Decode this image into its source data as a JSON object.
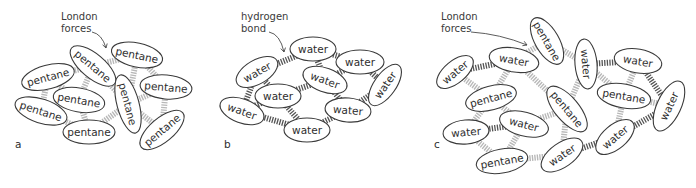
{
  "colors": {
    "london_bond": "#b8b8b8",
    "hydrogen_bond": "#555555",
    "outline": "#3a3a3a",
    "text": "#2e2e2e"
  },
  "legend": {
    "london_bond": "light grey hatched link",
    "hydrogen_bond": "dark grey hatched link"
  },
  "panels": [
    {
      "id": "a",
      "label": "a",
      "label_pos": [
        15,
        148
      ],
      "annotation": {
        "lines": [
          "London",
          "forces"
        ],
        "pos": [
          61,
          20
        ],
        "arrow": [
          [
            92,
            32
          ],
          [
            102,
            34
          ],
          [
            106,
            48
          ]
        ]
      },
      "molecules": [
        {
          "id": "a1",
          "text": "pentane",
          "cx": 48,
          "cy": 77,
          "rx": 27,
          "ry": 12,
          "rot": -15
        },
        {
          "id": "a2",
          "text": "pentane",
          "cx": 93,
          "cy": 66,
          "rx": 28,
          "ry": 12,
          "rot": 40
        },
        {
          "id": "a3",
          "text": "pentane",
          "cx": 137,
          "cy": 55,
          "rx": 26,
          "ry": 12,
          "rot": 12
        },
        {
          "id": "a4",
          "text": "pentane",
          "cx": 41,
          "cy": 111,
          "rx": 27,
          "ry": 12,
          "rot": 18
        },
        {
          "id": "a5",
          "text": "pentane",
          "cx": 79,
          "cy": 100,
          "rx": 26,
          "ry": 12,
          "rot": 10
        },
        {
          "id": "a6",
          "text": "pentane",
          "cx": 128,
          "cy": 104,
          "rx": 30,
          "ry": 11,
          "rot": 75
        },
        {
          "id": "a7",
          "text": "pentane",
          "cx": 166,
          "cy": 87,
          "rx": 26,
          "ry": 12,
          "rot": 5
        },
        {
          "id": "a8",
          "text": "pentane",
          "cx": 89,
          "cy": 132,
          "rx": 26,
          "ry": 12,
          "rot": 0
        },
        {
          "id": "a9",
          "text": "pentane",
          "cx": 162,
          "cy": 130,
          "rx": 27,
          "ry": 12,
          "rot": -40
        }
      ],
      "bonds": [
        {
          "from": "a1",
          "to": "a2",
          "type": "london"
        },
        {
          "from": "a2",
          "to": "a3",
          "type": "london"
        },
        {
          "from": "a1",
          "to": "a4",
          "type": "london"
        },
        {
          "from": "a1",
          "to": "a5",
          "type": "london"
        },
        {
          "from": "a2",
          "to": "a5",
          "type": "london"
        },
        {
          "from": "a2",
          "to": "a6",
          "type": "london"
        },
        {
          "from": "a3",
          "to": "a6",
          "type": "london"
        },
        {
          "from": "a3",
          "to": "a7",
          "type": "london"
        },
        {
          "from": "a6",
          "to": "a7",
          "type": "london"
        },
        {
          "from": "a4",
          "to": "a8",
          "type": "london"
        },
        {
          "from": "a5",
          "to": "a8",
          "type": "london"
        },
        {
          "from": "a8",
          "to": "a6",
          "type": "london"
        },
        {
          "from": "a6",
          "to": "a9",
          "type": "london"
        },
        {
          "from": "a7",
          "to": "a9",
          "type": "london"
        }
      ]
    },
    {
      "id": "b",
      "label": "b",
      "label_pos": [
        224,
        148
      ],
      "annotation": {
        "lines": [
          "hydrogen",
          "bond"
        ],
        "pos": [
          241,
          20
        ],
        "arrow": [
          [
            269,
            32
          ],
          [
            280,
            34
          ],
          [
            284,
            52
          ]
        ]
      },
      "molecules": [
        {
          "id": "b1",
          "text": "water",
          "cx": 313,
          "cy": 49,
          "rx": 23,
          "ry": 12,
          "rot": 0
        },
        {
          "id": "b2",
          "text": "water",
          "cx": 360,
          "cy": 62,
          "rx": 24,
          "ry": 12,
          "rot": 0
        },
        {
          "id": "b3",
          "text": "water",
          "cx": 257,
          "cy": 72,
          "rx": 23,
          "ry": 12,
          "rot": -30
        },
        {
          "id": "b4",
          "text": "water",
          "cx": 325,
          "cy": 80,
          "rx": 23,
          "ry": 12,
          "rot": 20
        },
        {
          "id": "b5",
          "text": "water",
          "cx": 385,
          "cy": 85,
          "rx": 24,
          "ry": 11,
          "rot": -55
        },
        {
          "id": "b6",
          "text": "water",
          "cx": 278,
          "cy": 96,
          "rx": 23,
          "ry": 12,
          "rot": 0
        },
        {
          "id": "b7",
          "text": "water",
          "cx": 242,
          "cy": 111,
          "rx": 23,
          "ry": 12,
          "rot": 20
        },
        {
          "id": "b8",
          "text": "water",
          "cx": 348,
          "cy": 110,
          "rx": 23,
          "ry": 12,
          "rot": 5
        },
        {
          "id": "b9",
          "text": "water",
          "cx": 307,
          "cy": 130,
          "rx": 23,
          "ry": 12,
          "rot": 0
        }
      ],
      "bonds": [
        {
          "from": "b3",
          "to": "b1",
          "type": "hydrogen"
        },
        {
          "from": "b1",
          "to": "b2",
          "type": "hydrogen"
        },
        {
          "from": "b1",
          "to": "b4",
          "type": "hydrogen"
        },
        {
          "from": "b2",
          "to": "b4",
          "type": "hydrogen"
        },
        {
          "from": "b2",
          "to": "b5",
          "type": "hydrogen"
        },
        {
          "from": "b3",
          "to": "b6",
          "type": "hydrogen"
        },
        {
          "from": "b3",
          "to": "b7",
          "type": "hydrogen"
        },
        {
          "from": "b4",
          "to": "b6",
          "type": "hydrogen"
        },
        {
          "from": "b4",
          "to": "b8",
          "type": "hydrogen"
        },
        {
          "from": "b5",
          "to": "b8",
          "type": "hydrogen"
        },
        {
          "from": "b6",
          "to": "b7",
          "type": "hydrogen"
        },
        {
          "from": "b6",
          "to": "b9",
          "type": "hydrogen"
        },
        {
          "from": "b7",
          "to": "b9",
          "type": "hydrogen"
        },
        {
          "from": "b8",
          "to": "b9",
          "type": "hydrogen"
        }
      ]
    },
    {
      "id": "c",
      "label": "c",
      "label_pos": [
        434,
        148
      ],
      "annotation": {
        "lines": [
          "London",
          "forces"
        ],
        "pos": [
          441,
          20
        ],
        "arrow": [
          [
            471,
            32
          ],
          [
            500,
            34
          ],
          [
            527,
            45
          ]
        ]
      },
      "molecules": [
        {
          "id": "c1",
          "text": "pentane",
          "cx": 547,
          "cy": 41,
          "rx": 26,
          "ry": 12,
          "rot": 60
        },
        {
          "id": "c2",
          "text": "water",
          "cx": 455,
          "cy": 72,
          "rx": 22,
          "ry": 11,
          "rot": -40
        },
        {
          "id": "c3",
          "text": "water",
          "cx": 514,
          "cy": 60,
          "rx": 25,
          "ry": 12,
          "rot": 10
        },
        {
          "id": "c4",
          "text": "water",
          "cx": 586,
          "cy": 64,
          "rx": 25,
          "ry": 11,
          "rot": 85
        },
        {
          "id": "c5",
          "text": "water",
          "cx": 638,
          "cy": 61,
          "rx": 24,
          "ry": 12,
          "rot": 10
        },
        {
          "id": "c6",
          "text": "pentane",
          "cx": 491,
          "cy": 98,
          "rx": 26,
          "ry": 12,
          "rot": -15
        },
        {
          "id": "c7",
          "text": "pentane",
          "cx": 567,
          "cy": 109,
          "rx": 28,
          "ry": 12,
          "rot": 50
        },
        {
          "id": "c8",
          "text": "pentane",
          "cx": 624,
          "cy": 96,
          "rx": 27,
          "ry": 12,
          "rot": 10
        },
        {
          "id": "c9",
          "text": "water",
          "cx": 669,
          "cy": 106,
          "rx": 27,
          "ry": 12,
          "rot": -65
        },
        {
          "id": "c10",
          "text": "water",
          "cx": 466,
          "cy": 132,
          "rx": 23,
          "ry": 12,
          "rot": -5
        },
        {
          "id": "c11",
          "text": "water",
          "cx": 524,
          "cy": 124,
          "rx": 25,
          "ry": 12,
          "rot": 15
        },
        {
          "id": "c12",
          "text": "water",
          "cx": 615,
          "cy": 137,
          "rx": 23,
          "ry": 12,
          "rot": -40
        },
        {
          "id": "c13",
          "text": "pentane",
          "cx": 502,
          "cy": 161,
          "rx": 26,
          "ry": 12,
          "rot": -10
        },
        {
          "id": "c14",
          "text": "water",
          "cx": 562,
          "cy": 155,
          "rx": 24,
          "ry": 12,
          "rot": -35
        }
      ],
      "bonds": [
        {
          "from": "c2",
          "to": "c3",
          "type": "hydrogen"
        },
        {
          "from": "c3",
          "to": "c1",
          "type": "london"
        },
        {
          "from": "c1",
          "to": "c4",
          "type": "london"
        },
        {
          "from": "c4",
          "to": "c5",
          "type": "hydrogen"
        },
        {
          "from": "c5",
          "to": "c9",
          "type": "hydrogen"
        },
        {
          "from": "c2",
          "to": "c6",
          "type": "london"
        },
        {
          "from": "c3",
          "to": "c6",
          "type": "london"
        },
        {
          "from": "c3",
          "to": "c7",
          "type": "london"
        },
        {
          "from": "c4",
          "to": "c7",
          "type": "london"
        },
        {
          "from": "c4",
          "to": "c8",
          "type": "london"
        },
        {
          "from": "c5",
          "to": "c8",
          "type": "london"
        },
        {
          "from": "c8",
          "to": "c9",
          "type": "london"
        },
        {
          "from": "c6",
          "to": "c10",
          "type": "london"
        },
        {
          "from": "c6",
          "to": "c11",
          "type": "london"
        },
        {
          "from": "c10",
          "to": "c11",
          "type": "hydrogen"
        },
        {
          "from": "c11",
          "to": "c7",
          "type": "london"
        },
        {
          "from": "c10",
          "to": "c13",
          "type": "london"
        },
        {
          "from": "c11",
          "to": "c13",
          "type": "london"
        },
        {
          "from": "c13",
          "to": "c14",
          "type": "london"
        },
        {
          "from": "c7",
          "to": "c14",
          "type": "london"
        },
        {
          "from": "c14",
          "to": "c12",
          "type": "hydrogen"
        },
        {
          "from": "c8",
          "to": "c12",
          "type": "london"
        },
        {
          "from": "c12",
          "to": "c9",
          "type": "hydrogen"
        }
      ]
    }
  ]
}
